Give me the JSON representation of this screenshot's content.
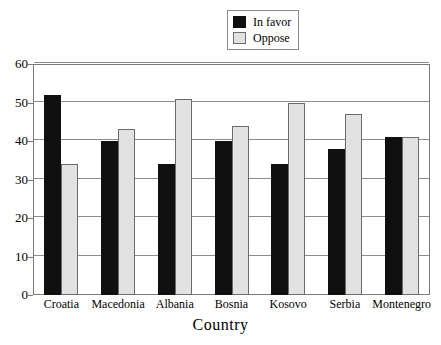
{
  "chart_data": {
    "type": "bar",
    "title": "",
    "xlabel": "Country",
    "ylabel": "",
    "ylim": [
      0,
      60
    ],
    "yticks": [
      0,
      10,
      20,
      30,
      40,
      50,
      60
    ],
    "grid": true,
    "legend_position": "top-center",
    "categories": [
      "Croatia",
      "Macedonia",
      "Albania",
      "Bosnia",
      "Kosovo",
      "Serbia",
      "Montenegro"
    ],
    "series": [
      {
        "name": "In favor",
        "color": "#101010",
        "values": [
          52,
          40,
          34,
          40,
          34,
          38,
          41
        ]
      },
      {
        "name": "Oppose",
        "color": "#e2e2e2",
        "values": [
          34,
          43,
          51,
          44,
          50,
          47,
          41
        ]
      }
    ]
  },
  "legend": {
    "items": [
      {
        "label": "In favor",
        "swatch": "favor-swatch"
      },
      {
        "label": "Oppose",
        "swatch": "oppose-swatch"
      }
    ]
  },
  "axes": {
    "y_tick_labels": [
      "60",
      "50",
      "40",
      "30",
      "20",
      "10",
      "0"
    ],
    "x_tick_labels": [
      "Croatia",
      "Macedonia",
      "Albania",
      "Bosnia",
      "Kosovo",
      "Serbia",
      "Montenegro"
    ],
    "x_axis_title": "Country"
  },
  "colors": {
    "in_favor": "#101010",
    "oppose": "#e2e2e2",
    "grid": "#8d8d8d",
    "frame": "#7a7a7a",
    "background": "#ffffff"
  }
}
